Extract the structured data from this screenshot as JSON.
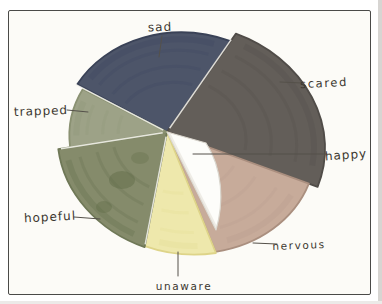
{
  "chart_data": {
    "type": "pie",
    "style": "hand_drawn_marker_on_paper",
    "title": "",
    "legend_position": "outside-callouts",
    "note": "Hand-drawn emotions pie chart; no numeric values printed. Shares estimated from drawn angles (degrees clockwise from 12 o'clock). The 'happy' slice is an uncolored white inner wedge overlapping the nervous sector.",
    "segments": [
      {
        "id": "sad",
        "label": "sad",
        "color": "#4d5569",
        "edge": "#3a4257",
        "streak": "#3d4660",
        "start_deg": 298,
        "end_deg": 395,
        "approx_percent": 27
      },
      {
        "id": "scared",
        "label": "scared",
        "color": "#635e59",
        "edge": "#504c48",
        "streak": "#544f4b",
        "start_deg": 35,
        "end_deg": 110,
        "approx_percent": 21
      },
      {
        "id": "nervous",
        "label": "nervous",
        "color": "#c7ab9a",
        "edge": "#aa8f7f",
        "streak": "#b79c8b",
        "start_deg": 110,
        "end_deg": 158,
        "approx_percent": 13
      },
      {
        "id": "unaware",
        "label": "unaware",
        "color": "#eee8ac",
        "edge": "#ded489",
        "streak": "#e3da8f",
        "start_deg": 158,
        "end_deg": 191,
        "approx_percent": 9
      },
      {
        "id": "hopeful",
        "label": "hopeful",
        "color": "#858b6b",
        "edge": "#6f7857",
        "streak": "#5f6b47",
        "start_deg": 191,
        "end_deg": 261,
        "approx_percent": 19
      },
      {
        "id": "trapped",
        "label": "trapped",
        "color": "#9da287",
        "edge": "#8a9172",
        "streak": "#8d9478",
        "start_deg": 261,
        "end_deg": 297,
        "approx_percent": 10
      },
      {
        "id": "happy",
        "label": "happy",
        "color": "#fdfdfa",
        "edge": "#d9d6cd",
        "streak": "#e4e1d8",
        "start_deg": 112,
        "end_deg": 156,
        "approx_percent": 12,
        "inner_wedge": true
      }
    ],
    "paper_color": "#fcfbf7",
    "frame_color": "#4a4a48",
    "pencil_color": "#55514a",
    "label_text_color": "#3b372f"
  }
}
